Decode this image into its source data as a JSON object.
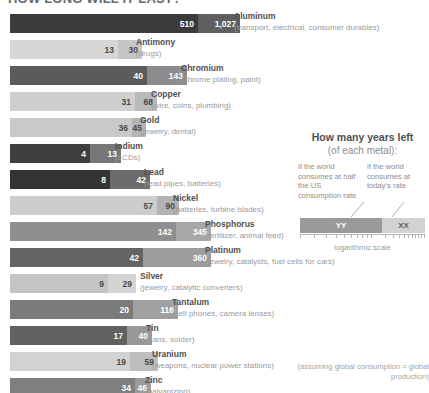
{
  "title": "HOW LONG WILL IT LAST?",
  "chart_data": {
    "type": "bar",
    "title": "How many years left (of each metal):",
    "xlabel": "logarithmic scale",
    "ylabel": "",
    "orientation": "horizontal",
    "scale": "logarithmic",
    "grid": false,
    "legend_position": "right",
    "series": [
      {
        "name": "if the world consumes at half the US consumption rate",
        "key": "half_us_rate"
      },
      {
        "name": "if the world consumes at today's rate",
        "key": "todays_rate"
      }
    ],
    "categories": [
      "Aluminum",
      "Antimony",
      "Chromium",
      "Copper",
      "Gold",
      "Indium",
      "Lead",
      "Nickel",
      "Phosphorus",
      "Platinum",
      "Silver",
      "Tantalum",
      "Tin",
      "Uranium",
      "Zinc"
    ],
    "values_half_us_rate": [
      510,
      13,
      40,
      31,
      36,
      4,
      8,
      57,
      142,
      42,
      9,
      20,
      17,
      19,
      34
    ],
    "values_todays_rate": [
      1027,
      30,
      143,
      68,
      45,
      13,
      42,
      90,
      345,
      360,
      29,
      116,
      40,
      59,
      46
    ]
  },
  "rows": [
    {
      "metal": "Aluminum",
      "uses": "(transport, electrical, consumer durables)",
      "v1": "510",
      "v2": "1,027",
      "w1": 188,
      "w2": 42,
      "c1": "#3b3b3b",
      "c2": "#5f5f5f",
      "lab": 234,
      "t1": "light",
      "t2": "light"
    },
    {
      "metal": "Antimony",
      "uses": "(drugs)",
      "v1": "13",
      "v2": "30",
      "w1": 108,
      "w2": 24,
      "c1": "#d6d6d6",
      "c2": "#c5c5c5",
      "lab": 136,
      "t1": "dark",
      "t2": "dark"
    },
    {
      "metal": "Chromium",
      "uses": "(chrome plating, paint)",
      "v1": "40",
      "v2": "143",
      "w1": 137,
      "w2": 40,
      "c1": "#5b5b5b",
      "c2": "#8c8c8c",
      "lab": 181,
      "t1": "light",
      "t2": "light"
    },
    {
      "metal": "Copper",
      "uses": "(wire, coins, plumbing)",
      "v1": "31",
      "v2": "68",
      "w1": 125,
      "w2": 22,
      "c1": "#cfcfcf",
      "c2": "#b9b9b9",
      "lab": 151,
      "t1": "dark",
      "t2": "dark"
    },
    {
      "metal": "Gold",
      "uses": "(jewelry, dental)",
      "v1": "36",
      "v2": "45",
      "w1": 122,
      "w2": 14,
      "c1": "#c9c9c9",
      "c2": "#b4b4b4",
      "lab": 140,
      "t1": "dark",
      "t2": "dark"
    },
    {
      "metal": "Indium",
      "uses": "(LCDs)",
      "v1": "4",
      "v2": "13",
      "w1": 80,
      "w2": 31,
      "c1": "#3e3e3e",
      "c2": "#777777",
      "lab": 115,
      "t1": "light",
      "t2": "light"
    },
    {
      "metal": "Lead",
      "uses": "(lead pipes, batteries)",
      "v1": "8",
      "v2": "42",
      "w1": 100,
      "w2": 40,
      "c1": "#343434",
      "c2": "#6b6b6b",
      "lab": 144,
      "t1": "light",
      "t2": "light"
    },
    {
      "metal": "Nickel",
      "uses": "(batteries, turbine blades)",
      "v1": "57",
      "v2": "90",
      "w1": 147,
      "w2": 22,
      "c1": "#cdcdcd",
      "c2": "#b3b3b3",
      "lab": 173,
      "t1": "dark",
      "t2": "dark"
    },
    {
      "metal": "Phosphorus",
      "uses": "(fertilizer, animal feed)",
      "v1": "142",
      "v2": "345",
      "w1": 166,
      "w2": 35,
      "c1": "#8f8f8f",
      "c2": "#a8a8a8",
      "lab": 205,
      "t1": "light",
      "t2": "light"
    },
    {
      "metal": "Platinum",
      "uses": "(jewelry, catalysts, fuel cells for cars)",
      "v1": "42",
      "v2": "360",
      "w1": 133,
      "w2": 68,
      "c1": "#646464",
      "c2": "#9d9d9d",
      "lab": 205,
      "t1": "light",
      "t2": "light"
    },
    {
      "metal": "Silver",
      "uses": "(jewelry, catalytic converters)",
      "v1": "9",
      "v2": "29",
      "w1": 98,
      "w2": 28,
      "c1": "#c4c4c4",
      "c2": "#d4d4d4",
      "lab": 140,
      "t1": "dark",
      "t2": "dark"
    },
    {
      "metal": "Tantalum",
      "uses": "(cell phones, camera lenses)",
      "v1": "20",
      "v2": "116",
      "w1": 123,
      "w2": 45,
      "c1": "#7b7b7b",
      "c2": "#a0a0a0",
      "lab": 172,
      "t1": "light",
      "t2": "light"
    },
    {
      "metal": "Tin",
      "uses": "(cans, solder)",
      "v1": "17",
      "v2": "40",
      "w1": 117,
      "w2": 25,
      "c1": "#616161",
      "c2": "#989898",
      "lab": 146,
      "t1": "light",
      "t2": "light"
    },
    {
      "metal": "Uranium",
      "uses": "(weapons, nuclear power stations)",
      "v1": "19",
      "v2": "59",
      "w1": 120,
      "w2": 28,
      "c1": "#d2d2d2",
      "c2": "#bebebe",
      "lab": 152,
      "t1": "dark",
      "t2": "dark"
    },
    {
      "metal": "Zinc",
      "uses": "(galvanizing)",
      "v1": "34",
      "v2": "46",
      "w1": 125,
      "w2": 16,
      "c1": "#7f7f7f",
      "c2": "#9c9c9c",
      "lab": 145,
      "t1": "light",
      "t2": "light"
    }
  ],
  "legend": {
    "title": "How many years left",
    "subtitle": "(of each metal):",
    "col_left": "if the world consumes at half the US consumption rate",
    "col_right": "if the world consumes at today's rate",
    "bar_left_label": "YY",
    "bar_right_label": "XX",
    "scale_label": "logarithmic scale"
  },
  "footnote": "(assuming global consumption = global production)"
}
